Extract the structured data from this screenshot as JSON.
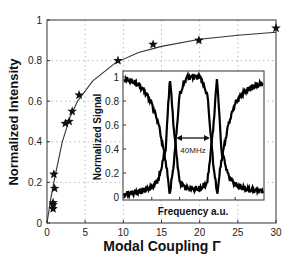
{
  "chart_data": [
    {
      "type": "scatter",
      "title": "",
      "xlabel": "Modal Coupling Γ",
      "ylabel": "Normalized Intensity",
      "xlim": [
        0,
        30
      ],
      "ylim": [
        0,
        1
      ],
      "xticks": [
        0,
        5,
        10,
        15,
        20,
        25,
        30
      ],
      "yticks": [
        0,
        0.2,
        0.4,
        0.6,
        0.8,
        1
      ],
      "grid": true,
      "series": [
        {
          "name": "measured",
          "marker": "star",
          "x": [
            0.8,
            0.8,
            0.8,
            0.9,
            1.0,
            2.4,
            2.9,
            3.3,
            4.2,
            9.3,
            13.9,
            19.9,
            30
          ],
          "y": [
            0.07,
            0.09,
            0.1,
            0.24,
            0.17,
            0.49,
            0.5,
            0.55,
            0.63,
            0.8,
            0.88,
            0.9,
            0.96
          ]
        },
        {
          "name": "fit",
          "style": "line",
          "formula": "y = x/(x+1.3)^approx",
          "x": [
            0,
            0.5,
            1,
            2,
            3,
            4,
            6,
            9,
            12,
            15,
            20,
            25,
            30
          ],
          "y": [
            0,
            0.12,
            0.22,
            0.4,
            0.52,
            0.6,
            0.7,
            0.79,
            0.84,
            0.87,
            0.905,
            0.925,
            0.94
          ]
        }
      ]
    },
    {
      "type": "line",
      "title": "inset",
      "xlabel": "Frequency a.u.",
      "ylabel": "Normalized Signal",
      "ylim": [
        0,
        1
      ],
      "yticks": [
        0,
        0.2,
        0.4,
        0.6,
        0.8,
        1
      ],
      "annotation": "40MHz",
      "series": [
        {
          "name": "transmission (dip pair)",
          "x": [
            0,
            0.05,
            0.1,
            0.15,
            0.2,
            0.25,
            0.3,
            0.33,
            0.36,
            0.4,
            0.45,
            0.5,
            0.55,
            0.6,
            0.64,
            0.67,
            0.7,
            0.75,
            0.8,
            0.85,
            0.9,
            0.95,
            1.0
          ],
          "y": [
            0.98,
            0.97,
            0.94,
            0.88,
            0.78,
            0.6,
            0.3,
            0.02,
            0.3,
            0.85,
            1.0,
            1.0,
            1.0,
            0.85,
            0.3,
            0.02,
            0.3,
            0.6,
            0.78,
            0.86,
            0.9,
            0.93,
            0.95
          ]
        },
        {
          "name": "reflection (peak pair)",
          "x": [
            0,
            0.1,
            0.2,
            0.25,
            0.3,
            0.33,
            0.36,
            0.4,
            0.45,
            0.5,
            0.55,
            0.6,
            0.64,
            0.67,
            0.7,
            0.75,
            0.8,
            0.9,
            1.0
          ],
          "y": [
            0.02,
            0.04,
            0.08,
            0.15,
            0.4,
            1.0,
            0.55,
            0.12,
            0.07,
            0.07,
            0.07,
            0.12,
            0.55,
            1.0,
            0.4,
            0.18,
            0.1,
            0.06,
            0.05
          ]
        }
      ]
    }
  ],
  "labels": {
    "main_xlabel": "Modal Coupling Γ",
    "main_ylabel": "Normalized Intensity",
    "inset_xlabel": "Frequency a.u.",
    "inset_ylabel": "Normalized Signal",
    "annotation": "40MHz"
  }
}
